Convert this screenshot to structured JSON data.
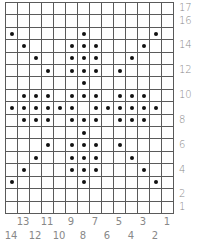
{
  "chart": {
    "columns": 14,
    "rows": 17,
    "row_labels": [
      {
        "label": "17",
        "row": 17
      },
      {
        "label": "16",
        "row": 16
      },
      {
        "label": "14",
        "row": 14
      },
      {
        "label": "12",
        "row": 12
      },
      {
        "label": "10",
        "row": 10
      },
      {
        "label": "8",
        "row": 8
      },
      {
        "label": "6",
        "row": 6
      },
      {
        "label": "4",
        "row": 4
      },
      {
        "label": "2",
        "row": 2
      },
      {
        "label": "1",
        "row": 1
      }
    ],
    "column_labels_odd": [
      "13",
      "11",
      "9",
      "7",
      "5",
      "3",
      "1"
    ],
    "column_labels_even": [
      "14",
      "12",
      "10",
      "8",
      "6",
      "4",
      "2"
    ],
    "dots_by_row": {
      "17": [],
      "16": [],
      "15": [
        0,
        6,
        12
      ],
      "14": [
        1,
        5,
        6,
        7,
        11
      ],
      "13": [
        2,
        5,
        6,
        7,
        10
      ],
      "12": [
        3,
        5,
        6,
        7,
        9
      ],
      "11": [
        6
      ],
      "10": [
        1,
        2,
        3,
        5,
        6,
        7,
        9,
        10,
        11
      ],
      "9": [
        0,
        1,
        2,
        3,
        4,
        5,
        7,
        8,
        9,
        10,
        11,
        12
      ],
      "8": [
        1,
        2,
        3,
        5,
        6,
        7,
        9,
        10,
        11
      ],
      "7": [
        6
      ],
      "6": [
        3,
        5,
        6,
        7,
        9
      ],
      "5": [
        2,
        5,
        6,
        7,
        10
      ],
      "4": [
        1,
        5,
        6,
        7,
        11
      ],
      "3": [
        0,
        6,
        12
      ],
      "2": [],
      "1": []
    },
    "colors": {
      "grid": "#5a5a5a",
      "dot": "#111111",
      "label": "#888888"
    }
  }
}
